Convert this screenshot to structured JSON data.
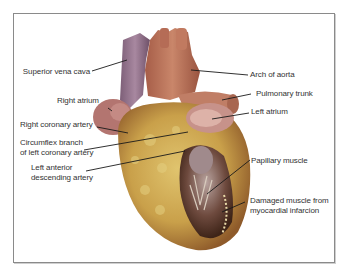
{
  "figure": {
    "colors": {
      "frame_border": "#8a8a8a",
      "vena_cava": "#8f6f86",
      "aorta": "#b8735a",
      "myocardium": "#c9a24e",
      "fat": "#d9c168",
      "atrium": "#b97a74",
      "leader_line": "#1a1a1a",
      "label_text": "#333333"
    },
    "labels": {
      "superior_vena_cava": "Superior vena cava",
      "arch_of_aorta": "Arch of aorta",
      "right_atrium": "Right atrium",
      "pulmonary_trunk": "Pulmonary trunk",
      "left_atrium": "Left atrium",
      "right_coronary_artery": "Right coronary artery",
      "circumflex_line1": "Circumflex branch",
      "circumflex_line2": "of left coronary artery",
      "lad_line1": "Left anterior",
      "lad_line2": "descending artery",
      "papillary_muscle": "Papillary muscle",
      "damaged_line1": "Damaged muscle from",
      "damaged_line2": "myocardial infarcion"
    }
  }
}
